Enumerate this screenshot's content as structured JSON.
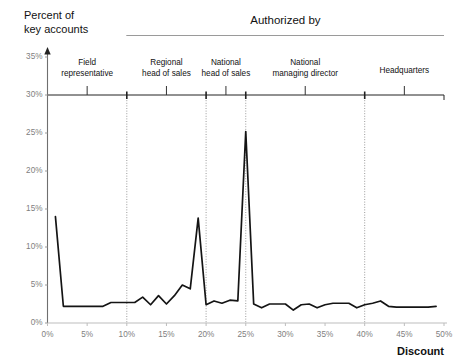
{
  "figure": {
    "y_axis_title_line1": "Percent of",
    "y_axis_title_line2": "key accounts",
    "x_axis_title": "Discount",
    "bracket_title": "Authorized by"
  },
  "categories": [
    {
      "name": "field-representative",
      "line1": "Field",
      "line2": "representative",
      "center_pct": 5.0,
      "start_pct": 0.0,
      "end_pct": 10.0
    },
    {
      "name": "regional-head-of-sales",
      "line1": "Regional",
      "line2": "head of sales",
      "center_pct": 15.0,
      "start_pct": 10.0,
      "end_pct": 20.0
    },
    {
      "name": "national-head-of-sales",
      "line1": "National",
      "line2": "head of sales",
      "center_pct": 22.5,
      "start_pct": 20.0,
      "end_pct": 25.0
    },
    {
      "name": "national-managing-director",
      "line1": "National",
      "line2": "managing director",
      "center_pct": 32.5,
      "start_pct": 25.0,
      "end_pct": 40.0
    },
    {
      "name": "headquarters",
      "line1": "Headquarters",
      "line2": "",
      "center_pct": 45.0,
      "start_pct": 40.0,
      "end_pct": 50.0
    }
  ],
  "divider_positions_pct": [
    10,
    20,
    25,
    40
  ],
  "chart_data": {
    "type": "line",
    "title": "Authorized by",
    "xlabel": "Discount",
    "ylabel": "Percent of key accounts",
    "xlim": [
      0,
      50
    ],
    "ylim": [
      0,
      35
    ],
    "xticks": [
      0,
      5,
      10,
      15,
      20,
      25,
      30,
      35,
      40,
      45,
      50
    ],
    "xtick_labels": [
      "0%",
      "5%",
      "10%",
      "15%",
      "20%",
      "25%",
      "30%",
      "35%",
      "40%",
      "45%",
      "50%"
    ],
    "yticks": [
      0,
      5,
      10,
      15,
      20,
      25,
      30,
      35
    ],
    "ytick_labels": [
      "0%",
      "5%",
      "10%",
      "15%",
      "20%",
      "25%",
      "30%",
      "35%"
    ],
    "grid": false,
    "legend": "none",
    "line_color": "#141414",
    "series": [
      {
        "name": "percent-of-key-accounts",
        "x": [
          1.0,
          2.0,
          3.0,
          4.0,
          5.0,
          6.0,
          7.0,
          8.0,
          9.0,
          10.0,
          11.0,
          12.0,
          13.0,
          14.0,
          15.0,
          16.0,
          17.0,
          18.0,
          19.0,
          20.0,
          21.0,
          22.0,
          23.0,
          24.0,
          25.0,
          26.0,
          27.0,
          28.0,
          29.0,
          30.0,
          31.0,
          32.0,
          33.0,
          34.0,
          35.0,
          36.0,
          37.0,
          38.0,
          39.0,
          40.0,
          41.0,
          42.0,
          43.0,
          44.0,
          45.0,
          46.0,
          47.0,
          48.0,
          49.0
        ],
        "y": [
          14.0,
          2.2,
          2.2,
          2.2,
          2.2,
          2.2,
          2.2,
          2.7,
          2.7,
          2.7,
          2.7,
          3.4,
          2.4,
          3.6,
          2.5,
          3.6,
          5.0,
          4.5,
          13.8,
          2.4,
          2.9,
          2.6,
          3.0,
          2.9,
          25.2,
          2.5,
          2.0,
          2.5,
          2.5,
          2.5,
          1.7,
          2.4,
          2.5,
          2.0,
          2.4,
          2.6,
          2.6,
          2.6,
          2.0,
          2.4,
          2.6,
          2.9,
          2.2,
          2.1,
          2.1,
          2.1,
          2.1,
          2.1,
          2.2
        ]
      }
    ],
    "peaks": [
      {
        "x_pct": 1.0,
        "y_pct": 14.0,
        "label": "first-point-peak"
      },
      {
        "x_pct": 19.0,
        "y_pct": 13.8,
        "label": "regional-boundary-peak"
      },
      {
        "x_pct": 25.0,
        "y_pct": 25.2,
        "label": "national-head-peak"
      }
    ]
  }
}
